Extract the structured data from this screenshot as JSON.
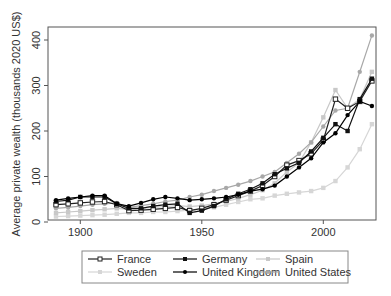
{
  "chart_data": {
    "type": "line",
    "title": "",
    "xlabel": "",
    "ylabel": "Average private wealth (thousands 2020 US$)",
    "xlim": [
      1887,
      2022
    ],
    "ylim": [
      0,
      420
    ],
    "xticks": [
      1900,
      1950,
      2000
    ],
    "yticks": [
      0,
      100,
      200,
      300,
      400
    ],
    "grid": false,
    "legend_position": "bottom",
    "x": [
      1890,
      1895,
      1900,
      1905,
      1910,
      1915,
      1920,
      1925,
      1930,
      1935,
      1940,
      1945,
      1950,
      1955,
      1960,
      1965,
      1970,
      1975,
      1980,
      1985,
      1990,
      1995,
      2000,
      2005,
      2010,
      2015,
      2020
    ],
    "series": [
      {
        "name": "France",
        "color": "#222222",
        "marker": "hollow-square",
        "values": [
          38,
          40,
          42,
          44,
          45,
          38,
          25,
          26,
          28,
          30,
          32,
          25,
          30,
          38,
          48,
          58,
          68,
          80,
          100,
          125,
          135,
          150,
          180,
          270,
          250,
          265,
          310
        ]
      },
      {
        "name": "Germany",
        "color": "#111111",
        "marker": "filled-square",
        "values": [
          45,
          48,
          55,
          55,
          55,
          40,
          30,
          30,
          35,
          38,
          40,
          20,
          25,
          35,
          50,
          62,
          72,
          85,
          105,
          118,
          130,
          155,
          185,
          215,
          200,
          270,
          315
        ]
      },
      {
        "name": "Spain",
        "color": "#c8c8c8",
        "marker": "filled-square",
        "values": [
          20,
          22,
          24,
          26,
          28,
          30,
          28,
          30,
          32,
          34,
          36,
          34,
          36,
          40,
          45,
          52,
          60,
          70,
          85,
          110,
          130,
          175,
          230,
          290,
          250,
          270,
          330
        ]
      },
      {
        "name": "Sweden",
        "color": "#d6d6d6",
        "marker": "filled-square",
        "values": [
          12,
          13,
          14,
          15,
          16,
          18,
          20,
          20,
          22,
          22,
          24,
          26,
          28,
          32,
          38,
          44,
          50,
          52,
          58,
          62,
          65,
          68,
          75,
          90,
          120,
          160,
          215
        ]
      },
      {
        "name": "United Kingdom",
        "color": "#000000",
        "marker": "filled-circle",
        "values": [
          48,
          52,
          55,
          58,
          58,
          40,
          35,
          42,
          50,
          55,
          52,
          48,
          50,
          52,
          55,
          60,
          68,
          72,
          80,
          100,
          120,
          140,
          175,
          195,
          235,
          265,
          255
        ]
      },
      {
        "name": "United States",
        "color": "#a8a8a8",
        "marker": "filled-circle",
        "values": [
          30,
          32,
          35,
          38,
          40,
          42,
          32,
          36,
          40,
          45,
          48,
          55,
          60,
          68,
          75,
          82,
          90,
          100,
          110,
          130,
          150,
          175,
          210,
          245,
          250,
          330,
          410
        ]
      }
    ]
  },
  "axes": {
    "ylabel": "Average private wealth (thousands 2020 US$)",
    "yticks": [
      "0",
      "100",
      "200",
      "300",
      "400"
    ],
    "xticks": [
      "1900",
      "1950",
      "2000"
    ]
  },
  "legend": {
    "items": [
      "France",
      "Germany",
      "Spain",
      "Sweden",
      "United Kingdom",
      "United States"
    ]
  }
}
